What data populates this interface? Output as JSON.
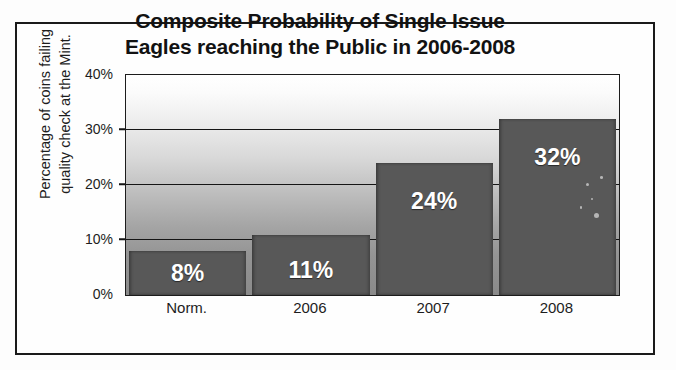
{
  "chart_data": {
    "type": "bar",
    "title": "Composite Probability of Single Issue Eagles reaching the Public in 2006-2008",
    "title_lines": [
      "Composite Probability of Single Issue",
      "Eagles reaching the Public in 2006-2008"
    ],
    "categories": [
      "Norm.",
      "2006",
      "2007",
      "2008"
    ],
    "values": [
      8,
      11,
      24,
      32
    ],
    "data_labels": [
      "8%",
      "11%",
      "24%",
      "32%"
    ],
    "xlabel": "",
    "ylabel": "Percentage of coins failing quality check at the Mint.",
    "ylabel_lines": [
      "Percentage of coins failing",
      "quality check at the Mint."
    ],
    "ylim": [
      0,
      40
    ],
    "ytick_values": [
      0,
      10,
      20,
      30,
      40
    ],
    "ytick_labels": [
      "0%",
      "10%",
      "20%",
      "30%",
      "40%"
    ],
    "gridlines": [
      10,
      20,
      30
    ],
    "grid": true,
    "legend": false,
    "legend_position": "none",
    "series": [
      {
        "name": "Percentage of coins failing quality check at the Mint.",
        "values": [
          8,
          11,
          24,
          32
        ]
      }
    ],
    "colors": {
      "bar_fill": "#585858",
      "bar_label_text": "#ffffff",
      "gridline": "#151515",
      "axis_line": "#1c1c1c",
      "frame_border": "#1a1a1a",
      "plot_bg_top": "#ffffff",
      "plot_bg_bottom": "#8a8a8a",
      "title_text": "#121212",
      "axis_text": "#1d1d1d",
      "page_bg": "#fdfdfd"
    }
  }
}
